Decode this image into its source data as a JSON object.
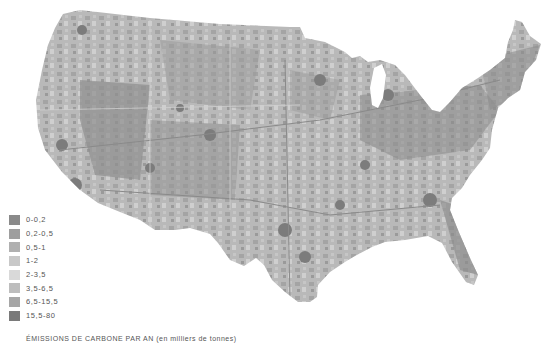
{
  "map": {
    "subject": "Contiguous United States carbon emissions per year",
    "land_base_color": "#b8b8b8",
    "background_color": "#ffffff"
  },
  "legend": {
    "items": [
      {
        "label": "0-0,2",
        "color": "#8a8a8a"
      },
      {
        "label": "0,2-0,5",
        "color": "#9e9e9e"
      },
      {
        "label": "0,5-1",
        "color": "#b0b0b0"
      },
      {
        "label": "1-2",
        "color": "#c8c8c8"
      },
      {
        "label": "2-3,5",
        "color": "#d9d9d9"
      },
      {
        "label": "3,5-6,5",
        "color": "#bdbdbd"
      },
      {
        "label": "6,5-15,5",
        "color": "#a6a6a6"
      },
      {
        "label": "15,5-80",
        "color": "#7a7a7a"
      }
    ]
  },
  "caption": "ÉMISSIONS DE CARBONE PAR AN (en milliers de tonnes)"
}
